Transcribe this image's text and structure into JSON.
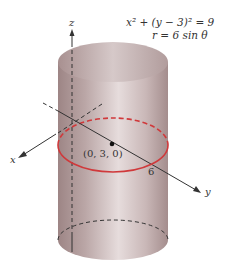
{
  "figure": {
    "equations": {
      "cartesian": "x² + (y − 3)² = 9",
      "polar": "r = 6 sin θ"
    },
    "axes": {
      "x": "x",
      "y": "y",
      "z": "z"
    },
    "point_label": "(0, 3, 0)",
    "radius_label": "6",
    "colors": {
      "cylinder": "#b8a3a3",
      "cylinder_highlight": "#e4d8d8",
      "circle": "#d0393b",
      "axes": "#333333"
    }
  }
}
